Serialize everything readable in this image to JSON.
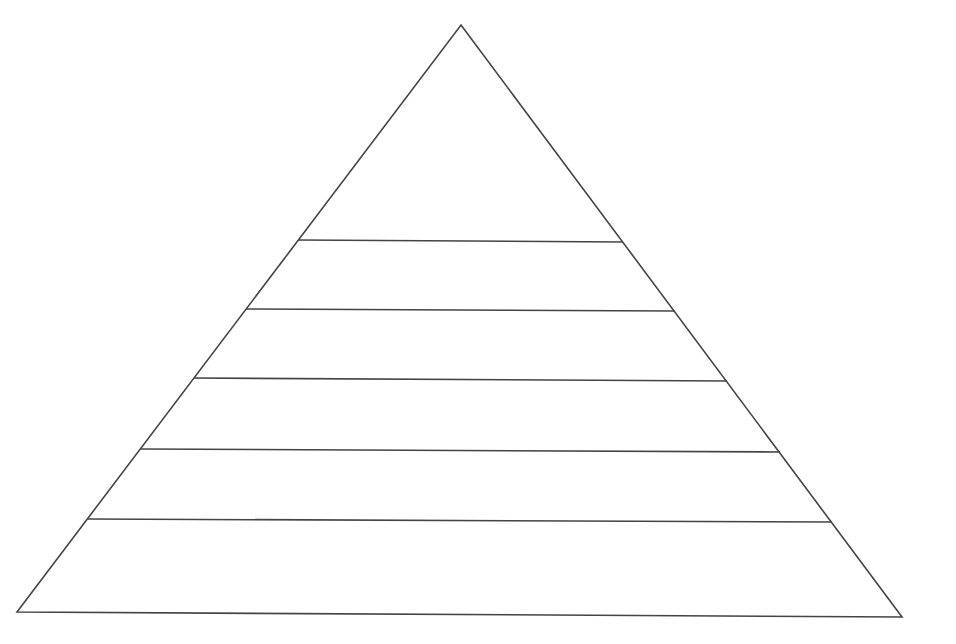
{
  "diagram": {
    "type": "pyramid",
    "canvas": {
      "width": 956,
      "height": 644,
      "background": "#ffffff"
    },
    "stroke": {
      "color": "#444444",
      "width": 1.6
    },
    "levels_count": 6,
    "labels": [],
    "outline": {
      "apex": [
        461,
        25
      ],
      "base_left": [
        17,
        612
      ],
      "base_right": [
        902,
        617
      ]
    },
    "level_lines": [
      {
        "x1": 298,
        "y1": 240,
        "x2": 623,
        "y2": 242
      },
      {
        "x1": 246,
        "y1": 309,
        "x2": 675,
        "y2": 311
      },
      {
        "x1": 194,
        "y1": 378,
        "x2": 727,
        "y2": 381
      },
      {
        "x1": 141,
        "y1": 449,
        "x2": 780,
        "y2": 452
      },
      {
        "x1": 88,
        "y1": 519,
        "x2": 832,
        "y2": 522
      }
    ]
  }
}
